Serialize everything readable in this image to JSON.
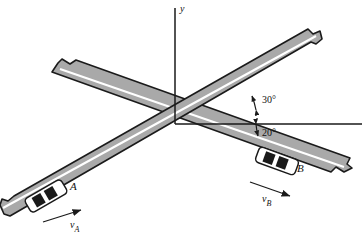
{
  "figure": {
    "type": "physics-kinematics-diagram",
    "background_color": "#ffffff",
    "road_fill": "#a9a9a9",
    "road_edge": "#1a1a1a",
    "road_stripe": "#ffffff",
    "axis_color": "#1a1a1a",
    "text_color": "#111111"
  },
  "axes": {
    "origin": {
      "x": 175,
      "y": 124
    },
    "y_axis": {
      "label": "y",
      "from_y": 8,
      "to_y": 124
    },
    "x_axis": {
      "label": "",
      "from_x": 175,
      "to_x": 362
    }
  },
  "angles": [
    {
      "name": "road-a-angle",
      "label": "30°",
      "value": 30,
      "unit": "degrees",
      "measured_from": "positive x-axis",
      "direction": "counterclockwise",
      "label_x": 262,
      "label_y": 103
    },
    {
      "name": "road-b-angle",
      "label": "20°",
      "value": 20,
      "unit": "degrees",
      "measured_from": "positive x-axis",
      "direction": "clockwise",
      "label_x": 262,
      "label_y": 135
    }
  ],
  "roads": [
    {
      "id": "road-a",
      "name": "road-a",
      "angle_deg": 30,
      "carries": "A",
      "direction": "lower-left to upper-right",
      "has_center_stripe": true
    },
    {
      "id": "road-b",
      "name": "road-b",
      "angle_deg": -20,
      "carries": "B",
      "direction": "upper-left to lower-right",
      "has_center_stripe": true
    }
  ],
  "cars": [
    {
      "id": "car-a",
      "label": "A",
      "label_x": 70,
      "label_y": 190,
      "road": "road-a",
      "angle_deg": 30,
      "body_color": "#ffffff",
      "window_color": "#1a1a1a",
      "center_x": 46,
      "center_y": 196
    },
    {
      "id": "car-b",
      "label": "B",
      "label_x": 297,
      "label_y": 172,
      "road": "road-b",
      "angle_deg": -20,
      "body_color": "#ffffff",
      "window_color": "#1a1a1a",
      "center_x": 277,
      "center_y": 161
    }
  ],
  "velocity_vectors": [
    {
      "id": "velocity-a",
      "symbol": "v",
      "subscript": "A",
      "label": "v",
      "belongs_to": "car-a",
      "angle_deg": 30,
      "points_toward": "upper-right",
      "tail_x": 43,
      "tail_y": 222,
      "head_x": 81,
      "head_y": 210,
      "label_x": 74,
      "label_y": 230
    },
    {
      "id": "velocity-b",
      "symbol": "v",
      "subscript": "B",
      "label": "v",
      "belongs_to": "car-b",
      "angle_deg": -20,
      "points_toward": "lower-right",
      "tail_x": 250,
      "tail_y": 182,
      "head_x": 290,
      "head_y": 196,
      "label_x": 265,
      "label_y": 204
    }
  ]
}
